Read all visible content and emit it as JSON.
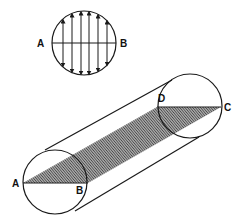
{
  "figure": {
    "type": "diagram",
    "inset": {
      "labels": {
        "left": "A",
        "right": "B"
      },
      "arrow_columns": 6
    },
    "cylinder": {
      "labels": {
        "a": "A",
        "b": "B",
        "c": "C",
        "d": "D"
      }
    }
  }
}
